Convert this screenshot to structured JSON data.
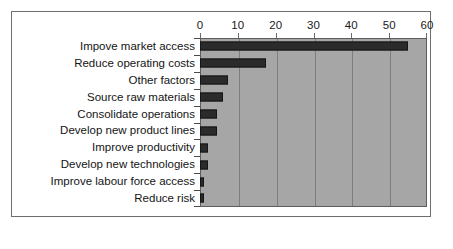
{
  "chart_data": {
    "type": "bar",
    "orientation": "horizontal",
    "title": "",
    "subtitle": "",
    "xlabel": "",
    "ylabel": "",
    "xlim": [
      0,
      60
    ],
    "xticks": [
      0,
      10,
      20,
      30,
      40,
      50,
      60
    ],
    "xtick_labels": [
      "0",
      "10",
      "20",
      "30",
      "40",
      "50",
      "60"
    ],
    "grid": true,
    "grid_axis": "x",
    "legend": false,
    "legend_position": "none",
    "axis_position": "top",
    "categories": [
      "Impove market access",
      "Reduce operating costs",
      "Other factors",
      "Source raw materials",
      "Consolidate operations",
      "Develop new product lines",
      "Improve productivity",
      "Develop new technologies",
      "Improve labour force access",
      "Reduce risk"
    ],
    "values": [
      55,
      17.5,
      7.5,
      6,
      4.5,
      4.5,
      2,
      2,
      1,
      1
    ],
    "series": [
      {
        "name": "",
        "values": [
          55,
          17.5,
          7.5,
          6,
          4.5,
          4.5,
          2,
          2,
          1,
          1
        ]
      }
    ]
  },
  "colors": {
    "bar_fill": "#2b2b2b",
    "bar_edge": "#151515",
    "plot_background": "#a6a6a6",
    "gridline": "#7d7d7d",
    "plot_border": "#5d5d5d",
    "frame_border": "#6e6e6e",
    "figure_background": "#ffffff",
    "label_text": "#141414"
  }
}
